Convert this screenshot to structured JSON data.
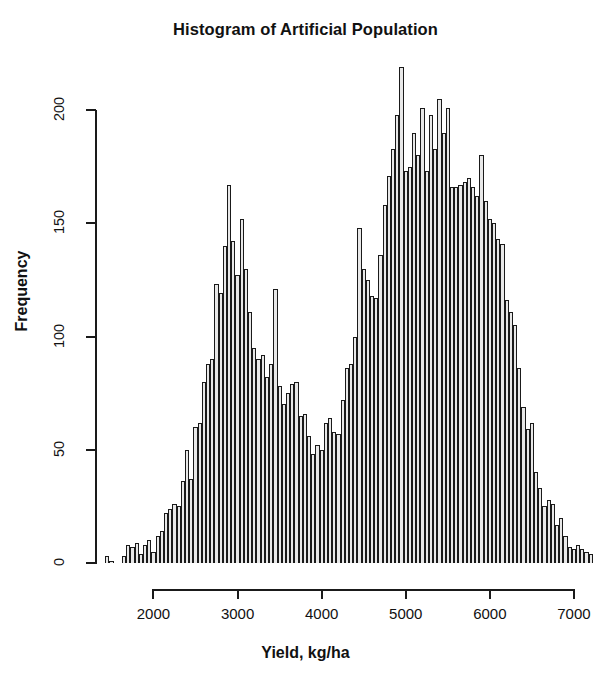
{
  "chart_data": {
    "type": "bar",
    "title": "Histogram of Artificial Population",
    "xlabel": "Yield, kg/ha",
    "ylabel": "Frequency",
    "xlim": [
      1400,
      7250
    ],
    "ylim": [
      0,
      220
    ],
    "grid": false,
    "legend": null,
    "bin_width": 50,
    "x_ticks": [
      2000,
      3000,
      4000,
      5000,
      6000,
      7000
    ],
    "x_tick_labels": [
      "2000",
      "3000",
      "4000",
      "5000",
      "6000",
      "7000"
    ],
    "y_ticks": [
      0,
      50,
      100,
      150,
      200
    ],
    "y_tick_labels": [
      "0",
      "50",
      "100",
      "150",
      "200"
    ],
    "bin_starts": [
      1425,
      1475,
      1525,
      1575,
      1625,
      1675,
      1725,
      1775,
      1825,
      1875,
      1925,
      1975,
      2025,
      2075,
      2125,
      2175,
      2225,
      2275,
      2325,
      2375,
      2425,
      2475,
      2525,
      2575,
      2625,
      2675,
      2725,
      2775,
      2825,
      2875,
      2925,
      2975,
      3025,
      3075,
      3125,
      3175,
      3225,
      3275,
      3325,
      3375,
      3425,
      3475,
      3525,
      3575,
      3625,
      3675,
      3725,
      3775,
      3825,
      3875,
      3925,
      3975,
      4025,
      4075,
      4125,
      4175,
      4225,
      4275,
      4325,
      4375,
      4425,
      4475,
      4525,
      4575,
      4625,
      4675,
      4725,
      4775,
      4825,
      4875,
      4925,
      4975,
      5025,
      5075,
      5125,
      5175,
      5225,
      5275,
      5325,
      5375,
      5425,
      5475,
      5525,
      5575,
      5625,
      5675,
      5725,
      5775,
      5825,
      5875,
      5925,
      5975,
      6025,
      6075,
      6125,
      6175,
      6225,
      6275,
      6325,
      6375,
      6425,
      6475,
      6525,
      6575,
      6625,
      6675,
      6725,
      6775,
      6825,
      6875,
      6925,
      6975,
      7025,
      7075,
      7125,
      7175
    ],
    "values": [
      3,
      1,
      0,
      0,
      3,
      8,
      7,
      9,
      4,
      8,
      10,
      5,
      12,
      14,
      22,
      24,
      26,
      25,
      36,
      50,
      37,
      60,
      62,
      80,
      88,
      90,
      123,
      119,
      140,
      167,
      142,
      127,
      152,
      130,
      111,
      95,
      90,
      92,
      82,
      88,
      121,
      78,
      70,
      75,
      79,
      80,
      65,
      66,
      56,
      48,
      52,
      50,
      62,
      64,
      58,
      57,
      72,
      86,
      88,
      100,
      148,
      130,
      125,
      118,
      117,
      136,
      158,
      171,
      183,
      198,
      219,
      173,
      175,
      190,
      180,
      201,
      173,
      198,
      183,
      205,
      190,
      201,
      166,
      166,
      167,
      168,
      170,
      166,
      162,
      180,
      160,
      152,
      150,
      143,
      141,
      116,
      111,
      105,
      86,
      69,
      59,
      62,
      40,
      33,
      25,
      28,
      26,
      17,
      20,
      12,
      7,
      6,
      8,
      6,
      5,
      4
    ]
  }
}
